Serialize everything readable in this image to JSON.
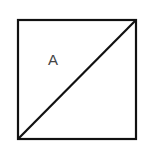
{
  "diagram": {
    "shape": "square",
    "label": "A",
    "diagonal": "bottom-left to top-right",
    "stroke_color": "#111111",
    "label_color": "#444444",
    "background": "#ffffff"
  }
}
